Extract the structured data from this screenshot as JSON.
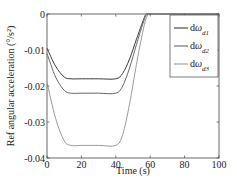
{
  "chart_data": {
    "type": "line",
    "title": "",
    "xlabel": "Time (s)",
    "ylabel": "Ref angular acceleration (°/s²)",
    "xlim": [
      0,
      100
    ],
    "ylim": [
      -0.04,
      0
    ],
    "xticks": [
      0,
      20,
      40,
      60,
      80,
      100
    ],
    "xtick_labels": [
      "0",
      "20",
      "40",
      "60",
      "80",
      "100"
    ],
    "yticks": [
      0,
      -0.01,
      -0.02,
      -0.03,
      -0.04
    ],
    "ytick_labels": [
      "0",
      "-0.01",
      "-0.02",
      "-0.03",
      "-0.04"
    ],
    "grid": false,
    "legend_position": "upper right",
    "x": [
      0,
      5,
      10,
      14,
      20,
      30,
      40,
      44,
      48,
      52,
      55,
      57,
      58,
      59,
      60,
      70,
      80,
      90,
      100
    ],
    "series": [
      {
        "name": "dω_d1",
        "label_main": "dω",
        "label_sub": "d1",
        "color": "#3a3a3a",
        "values": [
          -0.0095,
          -0.0145,
          -0.0175,
          -0.018,
          -0.018,
          -0.018,
          -0.018,
          -0.0165,
          -0.0125,
          -0.007,
          -0.003,
          -0.0005,
          0,
          0,
          0,
          0,
          0,
          0,
          0
        ]
      },
      {
        "name": "dω_d2",
        "label_main": "dω",
        "label_sub": "d2",
        "color": "#666666",
        "values": [
          -0.011,
          -0.0175,
          -0.0212,
          -0.022,
          -0.022,
          -0.022,
          -0.022,
          -0.02,
          -0.015,
          -0.0085,
          -0.0038,
          -0.001,
          -0.0002,
          0,
          0,
          0,
          0,
          0,
          0
        ]
      },
      {
        "name": "dω_d3",
        "label_main": "dω",
        "label_sub": "d3",
        "color": "#999999",
        "values": [
          -0.019,
          -0.029,
          -0.0352,
          -0.0365,
          -0.0365,
          -0.0365,
          -0.0365,
          -0.0335,
          -0.025,
          -0.014,
          -0.0065,
          -0.0022,
          -0.0008,
          0,
          0,
          0,
          0,
          0,
          0
        ]
      }
    ]
  },
  "ui": {
    "xlabel": "Time (s)",
    "ylabel": "Ref angular acceleration (°/s²)"
  }
}
